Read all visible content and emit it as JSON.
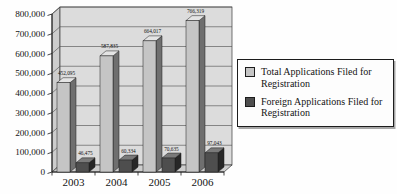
{
  "chart_data": {
    "type": "bar",
    "subtype": "3d-column",
    "title": "",
    "xlabel": "",
    "ylabel": "",
    "categories": [
      "2003",
      "2004",
      "2005",
      "2006"
    ],
    "series": [
      {
        "name": "Total Applications Filed for Registration",
        "values": [
          452095,
          587835,
          664017,
          766319
        ],
        "labels": [
          "452,095",
          "587,835",
          "664,017",
          "766,319"
        ],
        "color": "#c5c5c5",
        "color_top": "#e4e4e4",
        "color_side": "#6f6f6f"
      },
      {
        "name": "Foreign Applications Filed for Registration",
        "values": [
          46475,
          60334,
          70635,
          97043
        ],
        "labels": [
          "46,475",
          "60,334",
          "70,635",
          "97,043"
        ],
        "color": "#4e4e4e",
        "color_top": "#7a7a7a",
        "color_side": "#272727"
      }
    ],
    "ylim": [
      0,
      800000
    ],
    "ytick_interval": 100000,
    "ytick_labels": [
      "0",
      "100,000",
      "200,000",
      "300,000",
      "400,000",
      "500,000",
      "600,000",
      "700,000",
      "800,000"
    ],
    "grid": "horizontal",
    "legend_position": "right",
    "wall_color": "#dcdcdc",
    "side_color": "#cdcdcd",
    "line_color": "#3a3a3a"
  }
}
